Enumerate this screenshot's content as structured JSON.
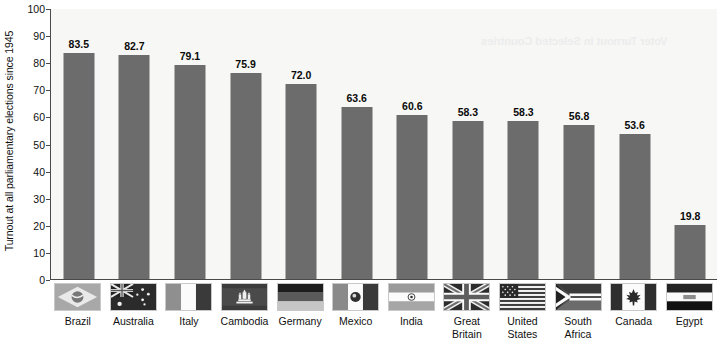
{
  "chart_data": {
    "type": "bar",
    "title": "",
    "subtitle": "",
    "xlabel": "",
    "ylabel": "Turnout at all parliamentary elections since 1945",
    "ylim": [
      0,
      100
    ],
    "yticks": [
      0,
      10,
      20,
      30,
      40,
      50,
      60,
      70,
      80,
      90,
      100
    ],
    "grid": false,
    "legend": "none",
    "categories": [
      "Brazil",
      "Australia",
      "Italy",
      "Cambodia",
      "Germany",
      "Mexico",
      "India",
      "Great\nBritain",
      "United\nStates",
      "South\nAfrica",
      "Canada",
      "Egypt"
    ],
    "values": [
      83.5,
      82.7,
      79.1,
      75.9,
      72.0,
      63.6,
      60.6,
      58.3,
      58.3,
      56.8,
      53.6,
      19.8
    ],
    "value_labels": [
      "83.5",
      "82.7",
      "79.1",
      "75.9",
      "72.0",
      "63.6",
      "60.6",
      "58.3",
      "58.3",
      "56.8",
      "53.6",
      "19.8"
    ],
    "bar_color": "#6c6c6c",
    "plot_background": "#f7f7f5",
    "axis_color": "#4a4a4a",
    "text_color": "#101010"
  },
  "axis": {
    "y_title": "Turnout at all parliamentary elections since 1945",
    "tick_labels": [
      "100",
      "90",
      "80",
      "70",
      "60",
      "50",
      "40",
      "30",
      "20",
      "10",
      "0"
    ]
  },
  "categories": [
    {
      "label": "Brazil",
      "value": "83.5",
      "flag_icon": "flag-brazil-icon"
    },
    {
      "label": "Australia",
      "value": "82.7",
      "flag_icon": "flag-australia-icon"
    },
    {
      "label": "Italy",
      "value": "79.1",
      "flag_icon": "flag-italy-icon"
    },
    {
      "label": "Cambodia",
      "value": "75.9",
      "flag_icon": "flag-cambodia-icon"
    },
    {
      "label": "Germany",
      "value": "72.0",
      "flag_icon": "flag-germany-icon"
    },
    {
      "label": "Mexico",
      "value": "63.6",
      "flag_icon": "flag-mexico-icon"
    },
    {
      "label": "India",
      "value": "60.6",
      "flag_icon": "flag-india-icon"
    },
    {
      "label": "Great\nBritain",
      "value": "58.3",
      "flag_icon": "flag-great-britain-icon"
    },
    {
      "label": "United\nStates",
      "value": "58.3",
      "flag_icon": "flag-united-states-icon"
    },
    {
      "label": "South\nAfrica",
      "value": "56.8",
      "flag_icon": "flag-south-africa-icon"
    },
    {
      "label": "Canada",
      "value": "53.6",
      "flag_icon": "flag-canada-icon"
    },
    {
      "label": "Egypt",
      "value": "19.8",
      "flag_icon": "flag-egypt-icon"
    }
  ],
  "artifacts": {
    "bleed_through_text": "Voter Turnout in Selected Countries"
  }
}
